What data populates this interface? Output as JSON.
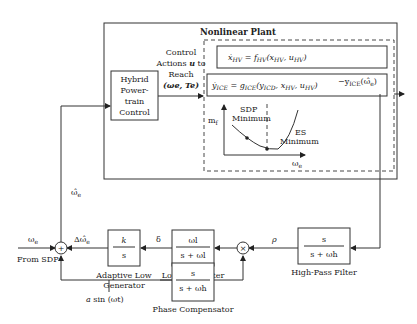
{
  "plant": {
    "title": "Nonlinear Plant",
    "eq1": "ẋHV = fHV(xHV, uHV)",
    "eq1_parts": {
      "lhs": "ẋ",
      "lhs_sub": "HV",
      "eq": " = f",
      "f_sub": "HV",
      "args": "(x",
      "a1_sub": "HV",
      "comma": ", u",
      "a2_sub": "HV",
      "close": ")"
    },
    "eq2": "ẏICE = gICE(yICD, xHV, uHV)",
    "eq2_parts": {
      "lhs": "ẏ",
      "lhs_sub": "ICE",
      "eq": " = g",
      "g_sub": "ICE",
      "args": "(y",
      "a1_sub": "ICD",
      "c1": ", x",
      "a2_sub": "HV",
      "c2": ", u",
      "a3_sub": "HV",
      "close": ")"
    },
    "plot": {
      "y_label": "m",
      "y_label_sub": "f",
      "x_label": "ω",
      "x_label_sub": "e",
      "sdp_label_1": "SDP",
      "sdp_label_2": "Minimum",
      "es_label_1": "ES",
      "es_label_2": "Minimum"
    }
  },
  "control_actions": {
    "line1": "Control",
    "line2_a": "Actions ",
    "line2_u": "u",
    "line2_b": " to",
    "line3": "Reach",
    "line4": "(ωe, Te)"
  },
  "hybrid_control": {
    "line1": "Hybrid",
    "line2": "Power-",
    "line3": "train",
    "line4": "Control"
  },
  "output_label": "−yICE(ω̂e)",
  "output_parts": {
    "prefix": "−y",
    "sub": "ICE",
    "arg": "(ω̂",
    "arg_sub": "e",
    "close": ")"
  },
  "feedback_label": {
    "main": "ω̂",
    "sub": "e"
  },
  "summing": {
    "sign": "+"
  },
  "omega_in": {
    "main": "ω",
    "sub": "e"
  },
  "from_sdp": "From SDP",
  "delta_omega": {
    "main": "Δω̂",
    "sub": "e"
  },
  "blocks": {
    "integrator": {
      "num": "k",
      "den": "s",
      "caption_1": "Adaptive Low",
      "caption_2": "Generator"
    },
    "lowpass": {
      "num": "ωl",
      "den": "s + ωl",
      "caption": "Low-Pass Filter"
    },
    "highpass": {
      "num": "s",
      "den": "s + ωh",
      "caption": "High-Pass Filter"
    },
    "phase": {
      "num": "s",
      "den": "s + ωh",
      "caption": "Phase Compensator"
    }
  },
  "multiplier": {
    "sign": "×"
  },
  "delta": "δ",
  "rho": "ρ",
  "dither": "a sin (ωt)",
  "dither_parts": {
    "a": "a",
    "rest": " sin (ωt)"
  }
}
